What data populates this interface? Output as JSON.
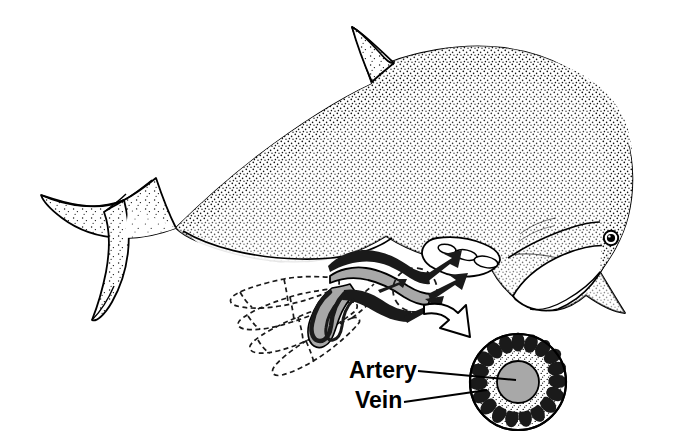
{
  "figure": {
    "background_color": "#ffffff",
    "ink_color": "#000000",
    "width": 681,
    "height": 444
  },
  "labels": {
    "artery": "Artery",
    "vein": "Vein"
  },
  "anatomy": {
    "body_parts": [
      {
        "name": "dorsal-fin",
        "shading": "stipple"
      },
      {
        "name": "tail-fluke",
        "shading": "stipple"
      },
      {
        "name": "pectoral-flipper",
        "shading": "stipple"
      },
      {
        "name": "rostrum",
        "shading": "stipple"
      },
      {
        "name": "eye",
        "shading": "solid"
      },
      {
        "name": "melon",
        "shading": "stipple"
      }
    ]
  },
  "inset": {
    "flipper_skeleton_style": "dashed-outline",
    "digit_count": 4,
    "vessel_bundle": {
      "artery_color": "#a8a8a8",
      "vein_color": "#1a1a1a",
      "flow_arrow_count": 3
    },
    "callout_circle_style": "dashed",
    "callout_arrow": "curved-hollow-arrow"
  },
  "cross_section": {
    "center_x": 518,
    "center_y": 382,
    "outer_radius": 48,
    "artery": {
      "radius": 21,
      "fill": "#a8a8a8",
      "stroke": "#000000"
    },
    "stipple_ring": {
      "inner_radius": 21,
      "outer_radius": 36,
      "fill": "#ffffff",
      "texture": "stipple"
    },
    "vein_ring": {
      "count": 19,
      "fill": "#1a1a1a",
      "orbit_radius": 40
    }
  },
  "leader_lines": [
    {
      "name": "artery-leader",
      "from_x": 418,
      "from_y": 371,
      "to_x": 516,
      "to_y": 380
    },
    {
      "name": "vein-leader",
      "from_x": 404,
      "from_y": 401,
      "to_x": 486,
      "to_y": 389
    }
  ],
  "colors": {
    "stroke": "#000000",
    "artery_gray": "#a8a8a8",
    "vein_black": "#1a1a1a",
    "paper": "#ffffff"
  }
}
